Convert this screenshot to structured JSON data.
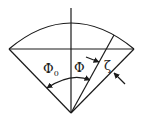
{
  "diagram": {
    "labels": {
      "phi0": "Φ",
      "phi0_sub": "0",
      "phi": "Φ",
      "zeta": "ζ"
    },
    "geometry": {
      "apex": [
        71,
        113
      ],
      "chord_left": [
        9,
        49
      ],
      "chord_right": [
        134,
        49
      ],
      "arc_top": [
        71,
        23
      ],
      "inner_line_end": [
        114,
        35
      ],
      "vertical_top": [
        71,
        8
      ]
    },
    "colors": {
      "line": "#1a1a1a",
      "background": "#ffffff"
    }
  }
}
